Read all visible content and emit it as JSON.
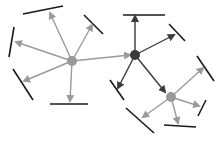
{
  "diagram": {
    "title": "",
    "colors": {
      "background": "#ffffff",
      "gray_node": "#999999",
      "dark_node": "#3a3a3a",
      "gray_edge": "#9a9a9a",
      "dark_edge": "#3a3a3a",
      "bar": "#1a1a1a"
    },
    "nodes": [
      {
        "id": "left",
        "x": 72,
        "y": 61,
        "r": 5,
        "color": "gray"
      },
      {
        "id": "center",
        "x": 135,
        "y": 55,
        "r": 5,
        "color": "dark"
      },
      {
        "id": "right",
        "x": 171,
        "y": 97,
        "r": 5,
        "color": "gray"
      }
    ],
    "edges": [
      {
        "from": "left",
        "x2": 50,
        "y2": 13,
        "color": "gray",
        "arrow": true
      },
      {
        "from": "left",
        "x2": 16,
        "y2": 42,
        "color": "gray",
        "arrow": true
      },
      {
        "from": "left",
        "x2": 24,
        "y2": 81,
        "color": "gray",
        "arrow": true
      },
      {
        "from": "left",
        "x2": 70,
        "y2": 101,
        "color": "gray",
        "arrow": true
      },
      {
        "from": "left",
        "x2": 92,
        "y2": 25,
        "color": "gray",
        "arrow": true
      },
      {
        "from": "left",
        "x2": 130,
        "y2": 55,
        "color": "gray",
        "arrow": true
      },
      {
        "from": "center",
        "x2": 135,
        "y2": 16,
        "color": "dark",
        "arrow": true
      },
      {
        "from": "center",
        "x2": 174,
        "y2": 35,
        "color": "dark",
        "arrow": true
      },
      {
        "from": "center",
        "x2": 118,
        "y2": 88,
        "color": "dark",
        "arrow": true
      },
      {
        "from": "center",
        "x2": 165,
        "y2": 92,
        "color": "dark",
        "arrow": true
      },
      {
        "from": "right",
        "x2": 203,
        "y2": 68,
        "color": "gray",
        "arrow": true
      },
      {
        "from": "right",
        "x2": 199,
        "y2": 106,
        "color": "gray",
        "arrow": true
      },
      {
        "from": "right",
        "x2": 178,
        "y2": 123,
        "color": "gray",
        "arrow": true
      },
      {
        "from": "right",
        "x2": 143,
        "y2": 117,
        "color": "gray",
        "arrow": true
      }
    ],
    "bars": [
      {
        "x1": 23,
        "y1": 14,
        "x2": 63,
        "y2": 6
      },
      {
        "x1": 14,
        "y1": 27,
        "x2": 9,
        "y2": 57
      },
      {
        "x1": 13,
        "y1": 69,
        "x2": 33,
        "y2": 100
      },
      {
        "x1": 50,
        "y1": 104,
        "x2": 88,
        "y2": 104
      },
      {
        "x1": 84,
        "y1": 15,
        "x2": 103,
        "y2": 34
      },
      {
        "x1": 123,
        "y1": 15,
        "x2": 165,
        "y2": 15
      },
      {
        "x1": 169,
        "y1": 24,
        "x2": 185,
        "y2": 41
      },
      {
        "x1": 110,
        "y1": 80,
        "x2": 124,
        "y2": 100
      },
      {
        "x1": 197,
        "y1": 56,
        "x2": 214,
        "y2": 81
      },
      {
        "x1": 206,
        "y1": 100,
        "x2": 198,
        "y2": 116
      },
      {
        "x1": 164,
        "y1": 125,
        "x2": 196,
        "y2": 127
      },
      {
        "x1": 126,
        "y1": 108,
        "x2": 154,
        "y2": 133
      }
    ]
  }
}
